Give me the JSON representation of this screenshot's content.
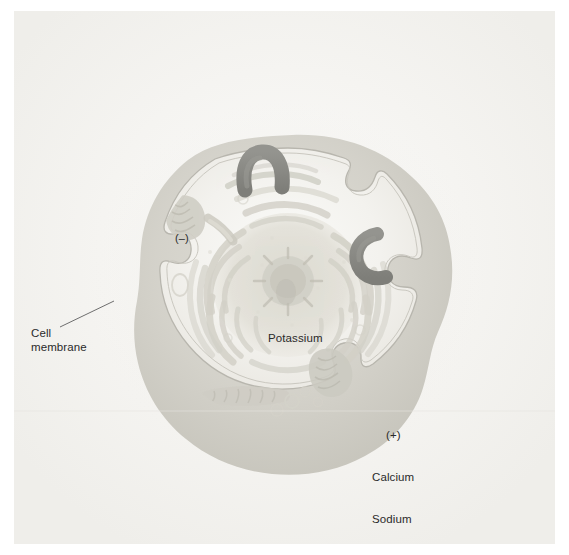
{
  "figure": {
    "background_color": "#ffffff",
    "paper_color": "#f4f4f2",
    "width": 569,
    "height": 555
  },
  "labels": {
    "cell_membrane": "Cell\nmembrane",
    "potassium": "Potassium",
    "negative_charge": "(–)",
    "positive_charge": "(+)",
    "calcium": "Calcium",
    "sodium": "Sodium"
  },
  "colors": {
    "text": "#2a2a2a",
    "leader_line": "#6e6e6e",
    "membrane_outer": "#cfcdc6",
    "membrane_inner": "#e6e4dd",
    "cytoplasm": "#f2f1ec",
    "organelle": "#d6d4cc",
    "organelle_light": "#e2e0d8",
    "channel_protein": "#8a8a88",
    "nucleus": "#dedcd4"
  },
  "structures": {
    "channel_proteins": [
      {
        "name": "potassium-channel-arch",
        "shape": "inverted-u",
        "position": "top"
      },
      {
        "name": "calcium-sodium-channel-c",
        "shape": "c-curve",
        "position": "right"
      }
    ],
    "membrane_notches": [
      {
        "name": "notch-top-right",
        "position": "top-right"
      },
      {
        "name": "notch-left",
        "position": "left"
      },
      {
        "name": "notch-bottom-right",
        "position": "bottom-right"
      }
    ],
    "organelles": [
      {
        "name": "mitochondrion-upper-left"
      },
      {
        "name": "mitochondrion-right"
      },
      {
        "name": "mitochondrion-bottom"
      },
      {
        "name": "nucleus"
      },
      {
        "name": "nucleolus"
      },
      {
        "name": "endoplasmic-reticulum"
      },
      {
        "name": "vesicles"
      }
    ]
  }
}
